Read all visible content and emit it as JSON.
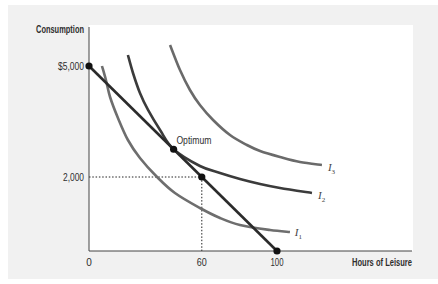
{
  "chart_data": {
    "type": "line",
    "title": "",
    "xlabel": "Hours of Leisure",
    "ylabel": "Consumption",
    "xlim": [
      0,
      172
    ],
    "ylim": [
      0,
      6100
    ],
    "grid": false,
    "legend": "inline curve labels",
    "x_ticks": [
      {
        "value": 0,
        "label": "0"
      },
      {
        "value": 60,
        "label": "60"
      },
      {
        "value": 100,
        "label": "100"
      }
    ],
    "y_ticks": [
      {
        "value": 2000,
        "label": "2,000"
      },
      {
        "value": 5000,
        "label": "$5,000"
      }
    ],
    "series": [
      {
        "name": "I1",
        "label_main": "I",
        "label_sub": "1",
        "color": "#6e6e6e",
        "width": 2.6,
        "points": [
          [
            6.9,
            5000
          ],
          [
            9.0,
            4622
          ],
          [
            11.2,
            4162
          ],
          [
            15.4,
            3595
          ],
          [
            20.7,
            3000
          ],
          [
            27.1,
            2514
          ],
          [
            36.2,
            2000
          ],
          [
            45.7,
            1568
          ],
          [
            59.0,
            1162
          ],
          [
            69.7,
            892
          ],
          [
            80.3,
            703
          ],
          [
            96.3,
            568
          ],
          [
            106.9,
            514
          ]
        ],
        "label_at": [
          109.5,
          405
        ]
      },
      {
        "name": "I2",
        "label_main": "I",
        "label_sub": "2",
        "color": "#3b3b3b",
        "width": 2.6,
        "points": [
          [
            20.7,
            5297
          ],
          [
            23.4,
            4811
          ],
          [
            27.1,
            4270
          ],
          [
            31.4,
            3811
          ],
          [
            37.8,
            3270
          ],
          [
            45.0,
            2750
          ],
          [
            59.0,
            2297
          ],
          [
            69.7,
            2108
          ],
          [
            80.3,
            1946
          ],
          [
            91.0,
            1811
          ],
          [
            101.6,
            1703
          ],
          [
            118.6,
            1568
          ]
        ],
        "label_at": [
          121.8,
          1405
        ]
      },
      {
        "name": "I3",
        "label_main": "I",
        "label_sub": "3",
        "color": "#6a6a6a",
        "width": 2.6,
        "points": [
          [
            43.1,
            5568
          ],
          [
            48.4,
            4892
          ],
          [
            53.7,
            4351
          ],
          [
            59.0,
            3946
          ],
          [
            66.0,
            3541
          ],
          [
            75.0,
            3135
          ],
          [
            84.0,
            2865
          ],
          [
            91.0,
            2703
          ],
          [
            101.6,
            2541
          ],
          [
            112.2,
            2405
          ],
          [
            123.9,
            2324
          ]
        ],
        "label_at": [
          127.1,
          2162
        ]
      },
      {
        "name": "Budget line",
        "color": "#2b2b2b",
        "width": 2.6,
        "points": [
          [
            0,
            5000
          ],
          [
            100,
            0
          ]
        ]
      }
    ],
    "points": [
      {
        "name": "budget-intercept-y",
        "x": 0,
        "y": 5000
      },
      {
        "name": "optimum",
        "x": 45,
        "y": 2750,
        "label": "Optimum",
        "label_at": [
          46.5,
          2900
        ]
      },
      {
        "name": "point-60-2000",
        "x": 60,
        "y": 2000,
        "guides": true
      },
      {
        "name": "budget-intercept-x",
        "x": 100,
        "y": 0
      }
    ]
  }
}
